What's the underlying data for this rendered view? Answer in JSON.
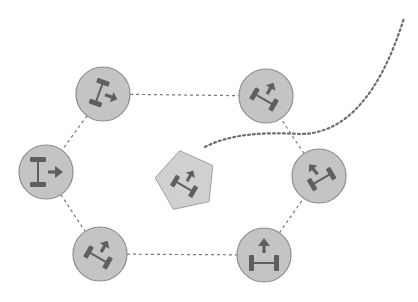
{
  "diagram": {
    "type": "robot-formation",
    "colors": {
      "background": "#ffffff",
      "node_fill": "#c4c4c4",
      "node_stroke": "#8e8e8e",
      "pentagon_fill": "#d0d0d0",
      "pentagon_stroke": "#a0a0a0",
      "icon": "#5f5f5f",
      "edge": "#7a7a7a",
      "trajectory": "#6e6e6e"
    },
    "nodes": [
      {
        "id": "top-left",
        "cx": 103,
        "cy": 94,
        "r": 27,
        "axle_angle": -70,
        "arrow_angle": 20
      },
      {
        "id": "top-right",
        "cx": 266,
        "cy": 96,
        "r": 27,
        "axle_angle": 30,
        "arrow_angle": -60
      },
      {
        "id": "left",
        "cx": 46,
        "cy": 172,
        "r": 27,
        "axle_angle": -90,
        "arrow_angle": 0
      },
      {
        "id": "right",
        "cx": 319,
        "cy": 176,
        "r": 27,
        "axle_angle": -30,
        "arrow_angle": -130
      },
      {
        "id": "bottom-left",
        "cx": 100,
        "cy": 254,
        "r": 27,
        "axle_angle": 30,
        "arrow_angle": -60
      },
      {
        "id": "bottom-right",
        "cx": 264,
        "cy": 255,
        "r": 27,
        "axle_angle": 0,
        "arrow_angle": -90
      }
    ],
    "leader": {
      "id": "leader-pentagon",
      "cx": 186,
      "cy": 181,
      "axle_angle": 30,
      "arrow_angle": -60
    },
    "edges": [
      [
        "top-left",
        "top-right"
      ],
      [
        "top-left",
        "left"
      ],
      [
        "left",
        "bottom-left"
      ],
      [
        "bottom-left",
        "bottom-right"
      ],
      [
        "bottom-right",
        "right"
      ],
      [
        "right",
        "top-right"
      ]
    ],
    "trajectory": {
      "label": "reference-path",
      "d": "M 205 147 C 230 134, 262 132, 300 134 C 345 134, 380 95, 404 18"
    }
  }
}
